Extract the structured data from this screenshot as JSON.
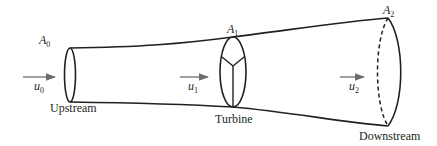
{
  "diagram": {
    "colors": {
      "stroke": "#231f20",
      "arrow": "#6d6e71",
      "background": "#ffffff"
    },
    "stations": [
      {
        "id": "upstream",
        "area_label": "A",
        "area_sub": "0",
        "velocity_label": "u",
        "velocity_sub": "0",
        "name": "Upstream"
      },
      {
        "id": "turbine",
        "area_label": "A",
        "area_sub": "1",
        "velocity_label": "u",
        "velocity_sub": "1",
        "name": "Turbine"
      },
      {
        "id": "downstream",
        "area_label": "A",
        "area_sub": "2",
        "velocity_label": "u",
        "velocity_sub": "2",
        "name": "Downstream"
      }
    ]
  }
}
